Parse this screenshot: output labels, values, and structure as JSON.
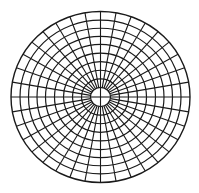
{
  "diagram": {
    "type": "polar-grid",
    "center": {
      "x": 100.5,
      "y": 97
    },
    "scale": {
      "rx": 1.0,
      "ry": 0.955
    },
    "ring_radii": [
      10,
      19,
      28,
      37,
      46,
      55,
      63.5,
      72,
      80.5,
      89.5
    ],
    "spoke_count": 36,
    "spoke_inner_radius": 10,
    "spoke_outer_radius": 89.5,
    "center_cross": true,
    "stroke_color": "#1a1a1a",
    "background_color": "#ffffff"
  }
}
